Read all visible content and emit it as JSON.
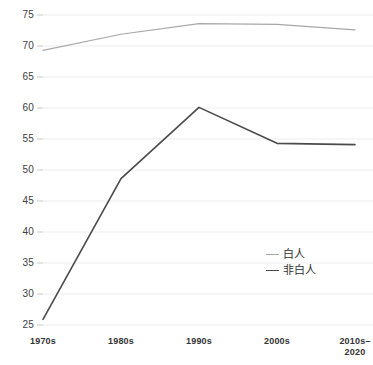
{
  "chart_data": {
    "type": "line",
    "title": "",
    "xlabel": "",
    "ylabel": "",
    "categories": [
      "1970s",
      "1980s",
      "1990s",
      "2000s",
      "2010s–\n2020"
    ],
    "series": [
      {
        "name": "白人",
        "color": "#a8a8a8",
        "values": [
          69.3,
          71.9,
          73.6,
          73.5,
          72.6
        ]
      },
      {
        "name": "非白人",
        "color": "#4a4a4a",
        "values": [
          25.9,
          48.6,
          60.1,
          54.3,
          54.1
        ]
      }
    ],
    "ylim": [
      25,
      75
    ],
    "yticks": [
      25,
      30,
      35,
      40,
      45,
      50,
      55,
      60,
      65,
      70,
      75
    ],
    "ytick_labels": [
      "25",
      "30",
      "35",
      "40",
      "45",
      "50",
      "55",
      "60",
      "65",
      "70",
      "75"
    ],
    "grid": true,
    "grid_color": "#ededed",
    "legend_position": "inside-right-lower",
    "background": "#ffffff"
  },
  "legend": {
    "entries": [
      {
        "label": "白人"
      },
      {
        "label": "非白人"
      }
    ]
  }
}
